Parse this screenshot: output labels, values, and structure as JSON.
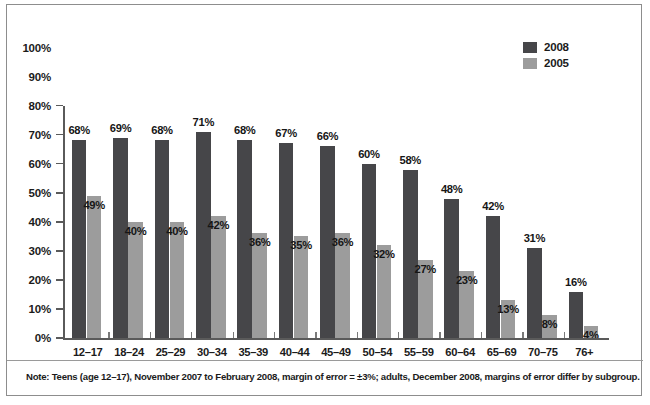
{
  "chart_data": {
    "type": "bar",
    "title": "",
    "subtitle": "",
    "xlabel": "",
    "ylabel": "",
    "ylim": [
      0,
      100
    ],
    "grid": false,
    "legend_position": "top-right",
    "categories": [
      "12–17",
      "18–24",
      "25–29",
      "30–34",
      "35–39",
      "40–44",
      "45–49",
      "50–54",
      "55–59",
      "60–64",
      "65–69",
      "70–75",
      "76+"
    ],
    "ytick_labels": [
      "100%",
      "90%",
      "80%",
      "70%",
      "60%",
      "50%",
      "40%",
      "30%",
      "20%",
      "10%",
      "0%"
    ],
    "ytick_values": [
      100,
      90,
      80,
      70,
      60,
      50,
      40,
      30,
      20,
      10,
      0
    ],
    "series": [
      {
        "name": "2008",
        "color": "#464649",
        "values": [
          68,
          69,
          68,
          71,
          68,
          67,
          66,
          60,
          58,
          48,
          42,
          31,
          16
        ],
        "value_labels": [
          "68%",
          "69%",
          "68%",
          "71%",
          "68%",
          "67%",
          "66%",
          "60%",
          "58%",
          "48%",
          "42%",
          "31%",
          "16%"
        ]
      },
      {
        "name": "2005",
        "color": "#9c9c9c",
        "values": [
          49,
          40,
          40,
          42,
          36,
          35,
          36,
          32,
          27,
          23,
          13,
          8,
          4
        ],
        "value_labels": [
          "49%",
          "40%",
          "40%",
          "42%",
          "36%",
          "35%",
          "36%",
          "32%",
          "27%",
          "23%",
          "13%",
          "8%",
          "4%"
        ]
      }
    ],
    "note": "Note: Teens (age 12–17), November 2007 to February 2008, margin of error = ±3%; adults, December 2008, margins of error differ by subgroup."
  },
  "legend": {
    "items": [
      {
        "label": "2008",
        "color": "#464649"
      },
      {
        "label": "2005",
        "color": "#9c9c9c"
      }
    ]
  }
}
